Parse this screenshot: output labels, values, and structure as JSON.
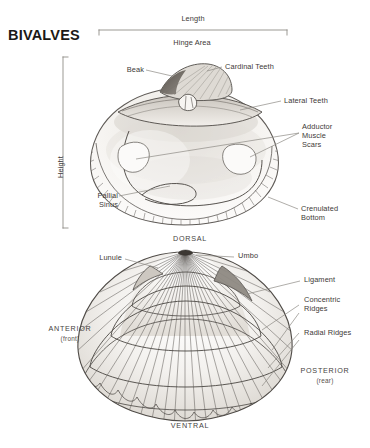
{
  "page": {
    "title": "BIVALVES",
    "background": "#ffffff",
    "ink": "#3d3936",
    "line_color": "#6d6a66",
    "shell_fill": "#fbfaf8"
  },
  "measurements": {
    "length": {
      "label": "Length",
      "orientation": "horizontal"
    },
    "height": {
      "label": "Height",
      "orientation": "vertical"
    }
  },
  "figures": [
    {
      "name": "interior-valve",
      "view": "interior",
      "labels": [
        {
          "key": "hinge_area",
          "text": "Hinge Area"
        },
        {
          "key": "beak",
          "text": "Beak"
        },
        {
          "key": "cardinal_teeth",
          "text": "Cardinal Teeth"
        },
        {
          "key": "lateral_teeth",
          "text": "Lateral Teeth"
        },
        {
          "key": "adductor",
          "text": "Adductor\nMuscle\nScars"
        },
        {
          "key": "pallial_sinus",
          "text": "Pallial\nSinus"
        },
        {
          "key": "crenulated",
          "text": "Crenulated\nBottom"
        }
      ]
    },
    {
      "name": "exterior-valve",
      "view": "exterior",
      "labels": [
        {
          "key": "dorsal",
          "text": "DORSAL"
        },
        {
          "key": "ventral",
          "text": "VENTRAL"
        },
        {
          "key": "anterior",
          "text": "ANTERIOR",
          "sub": "(front)"
        },
        {
          "key": "posterior",
          "text": "POSTERIOR",
          "sub": "(rear)"
        },
        {
          "key": "umbo",
          "text": "Umbo"
        },
        {
          "key": "lunule",
          "text": "Lunule"
        },
        {
          "key": "ligament",
          "text": "Ligament"
        },
        {
          "key": "concentric",
          "text": "Concentric\nRidges"
        },
        {
          "key": "radial",
          "text": "Radial Ridges"
        }
      ]
    }
  ]
}
